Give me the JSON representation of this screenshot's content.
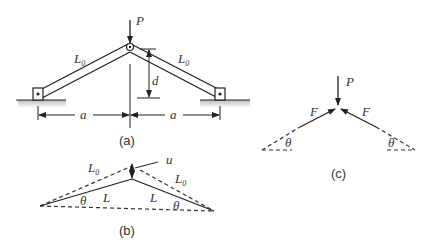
{
  "panels": {
    "a": {
      "caption": "(a)",
      "load_label": "P",
      "left_bar_label": "L",
      "left_bar_sub": "0",
      "right_bar_label": "L",
      "right_bar_sub": "0",
      "rise_label": "d",
      "left_span_label": "a",
      "right_span_label": "a"
    },
    "b": {
      "caption": "(b)",
      "original_left_label": "L",
      "original_left_sub": "0",
      "original_right_label": "L",
      "original_right_sub": "0",
      "deformed_left_label": "L",
      "deformed_right_label": "L",
      "displacement_label": "u",
      "left_angle_label": "θ",
      "right_angle_label": "θ"
    },
    "c": {
      "caption": "(c)",
      "load_label": "P",
      "left_force_label": "F",
      "right_force_label": "F",
      "left_angle_label": "θ",
      "right_angle_label": "θ"
    }
  }
}
